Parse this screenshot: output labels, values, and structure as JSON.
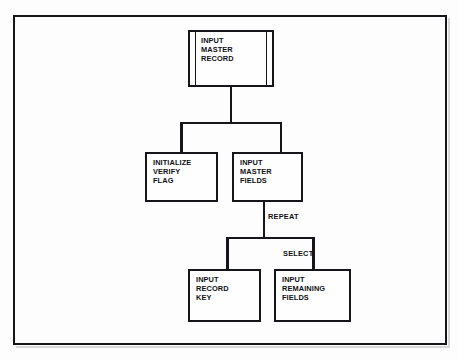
{
  "diagram": {
    "type": "structure-chart",
    "background_color": "#fdfdfd",
    "ink_color": "#15161a",
    "frame": {
      "label": "page-border"
    },
    "nodes": [
      {
        "id": "input-master-record",
        "label": "INPUT\nMASTER\nRECORD",
        "lines": [
          "INPUT",
          "MASTER",
          "RECORD"
        ],
        "style": "double-ruled",
        "level": 1
      },
      {
        "id": "initialize-verify-flag",
        "label": "INITIALIZE\nVERIFY\nFLAG",
        "lines": [
          "INITIALIZE",
          "VERIFY",
          "FLAG"
        ],
        "style": "plain",
        "level": 2
      },
      {
        "id": "input-master-fields",
        "label": "INPUT\nMASTER\nFIELDS",
        "lines": [
          "INPUT",
          "MASTER",
          "FIELDS"
        ],
        "style": "plain",
        "level": 2
      },
      {
        "id": "input-record-key",
        "label": "INPUT\nRECORD\nKEY",
        "lines": [
          "INPUT",
          "RECORD",
          "KEY"
        ],
        "style": "plain",
        "level": 3
      },
      {
        "id": "input-remaining-fields",
        "label": "INPUT\nREMAINING\nFIELDS",
        "lines": [
          "INPUT",
          "REMAINING",
          "FIELDS"
        ],
        "style": "plain",
        "level": 3
      }
    ],
    "edge_labels": [
      {
        "id": "repeat",
        "text": "REPEAT"
      },
      {
        "id": "select",
        "text": "SELECT"
      }
    ]
  }
}
